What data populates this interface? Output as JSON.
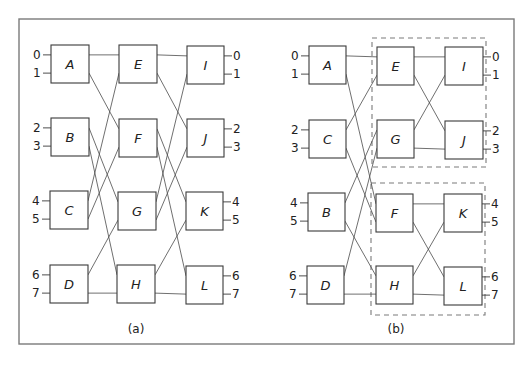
{
  "figure": {
    "frame": {
      "x": 19,
      "y": 19,
      "w": 495,
      "h": 325
    },
    "panels": [
      {
        "id": "a",
        "caption": "(a)",
        "caption_pos": [
          136,
          329
        ],
        "nodes": [
          {
            "label": "A",
            "x": 51,
            "y": 45,
            "w": 38,
            "h": 38
          },
          {
            "label": "B",
            "x": 51,
            "y": 118,
            "w": 38,
            "h": 38
          },
          {
            "label": "C",
            "x": 50,
            "y": 191,
            "w": 38,
            "h": 38
          },
          {
            "label": "D",
            "x": 50,
            "y": 265,
            "w": 38,
            "h": 38
          },
          {
            "label": "E",
            "x": 119,
            "y": 45,
            "w": 38,
            "h": 38
          },
          {
            "label": "F",
            "x": 119,
            "y": 119,
            "w": 38,
            "h": 38
          },
          {
            "label": "G",
            "x": 118,
            "y": 192,
            "w": 38,
            "h": 38
          },
          {
            "label": "H",
            "x": 117,
            "y": 265,
            "w": 38,
            "h": 38
          },
          {
            "label": "I",
            "x": 187,
            "y": 46,
            "w": 37,
            "h": 38
          },
          {
            "label": "J",
            "x": 187,
            "y": 119,
            "w": 37,
            "h": 38
          },
          {
            "label": "K",
            "x": 186,
            "y": 192,
            "w": 37,
            "h": 38
          },
          {
            "label": "L",
            "x": 186,
            "y": 266,
            "w": 37,
            "h": 38
          }
        ],
        "inputs_side": "left",
        "input_ports": [
          {
            "label": "0",
            "node": "A",
            "port": "top"
          },
          {
            "label": "1",
            "node": "A",
            "port": "bot"
          },
          {
            "label": "2",
            "node": "B",
            "port": "top"
          },
          {
            "label": "3",
            "node": "B",
            "port": "bot"
          },
          {
            "label": "4",
            "node": "C",
            "port": "top"
          },
          {
            "label": "5",
            "node": "C",
            "port": "bot"
          },
          {
            "label": "6",
            "node": "D",
            "port": "top"
          },
          {
            "label": "7",
            "node": "D",
            "port": "bot"
          }
        ],
        "output_ports": [
          {
            "label": "0",
            "node": "I",
            "port": "top"
          },
          {
            "label": "1",
            "node": "I",
            "port": "bot"
          },
          {
            "label": "2",
            "node": "J",
            "port": "top"
          },
          {
            "label": "3",
            "node": "J",
            "port": "bot"
          },
          {
            "label": "4",
            "node": "K",
            "port": "top"
          },
          {
            "label": "5",
            "node": "K",
            "port": "bot"
          },
          {
            "label": "6",
            "node": "L",
            "port": "top"
          },
          {
            "label": "7",
            "node": "L",
            "port": "bot"
          }
        ],
        "edges": [
          [
            "A",
            "top",
            "E",
            "top"
          ],
          [
            "A",
            "bot",
            "F",
            "top"
          ],
          [
            "B",
            "top",
            "G",
            "top"
          ],
          [
            "B",
            "bot",
            "H",
            "top"
          ],
          [
            "C",
            "top",
            "E",
            "bot"
          ],
          [
            "C",
            "bot",
            "F",
            "bot"
          ],
          [
            "D",
            "top",
            "G",
            "bot"
          ],
          [
            "D",
            "bot",
            "H",
            "bot"
          ],
          [
            "E",
            "top",
            "I",
            "top"
          ],
          [
            "E",
            "bot",
            "J",
            "top"
          ],
          [
            "F",
            "top",
            "K",
            "top"
          ],
          [
            "F",
            "bot",
            "L",
            "top"
          ],
          [
            "G",
            "top",
            "I",
            "bot"
          ],
          [
            "G",
            "bot",
            "J",
            "bot"
          ],
          [
            "H",
            "top",
            "K",
            "bot"
          ],
          [
            "H",
            "bot",
            "L",
            "bot"
          ]
        ],
        "dashed_groups": []
      },
      {
        "id": "b",
        "caption": "(b)",
        "caption_pos": [
          396,
          329
        ],
        "nodes": [
          {
            "label": "A",
            "x": 309,
            "y": 46,
            "w": 37,
            "h": 38
          },
          {
            "label": "C",
            "x": 309,
            "y": 120,
            "w": 37,
            "h": 38
          },
          {
            "label": "B",
            "x": 308,
            "y": 193,
            "w": 37,
            "h": 38
          },
          {
            "label": "D",
            "x": 307,
            "y": 266,
            "w": 37,
            "h": 38
          },
          {
            "label": "E",
            "x": 377,
            "y": 47,
            "w": 37,
            "h": 38
          },
          {
            "label": "G",
            "x": 377,
            "y": 120,
            "w": 37,
            "h": 38
          },
          {
            "label": "F",
            "x": 376,
            "y": 194,
            "w": 37,
            "h": 38
          },
          {
            "label": "H",
            "x": 376,
            "y": 266,
            "w": 37,
            "h": 38
          },
          {
            "label": "I",
            "x": 445,
            "y": 47,
            "w": 38,
            "h": 38
          },
          {
            "label": "J",
            "x": 445,
            "y": 121,
            "w": 38,
            "h": 38
          },
          {
            "label": "K",
            "x": 444,
            "y": 194,
            "w": 38,
            "h": 38
          },
          {
            "label": "L",
            "x": 444,
            "y": 267,
            "w": 38,
            "h": 38
          }
        ],
        "input_ports": [
          {
            "label": "0",
            "node": "A",
            "port": "top"
          },
          {
            "label": "1",
            "node": "A",
            "port": "bot"
          },
          {
            "label": "2",
            "node": "C",
            "port": "top"
          },
          {
            "label": "3",
            "node": "C",
            "port": "bot"
          },
          {
            "label": "4",
            "node": "B",
            "port": "top"
          },
          {
            "label": "5",
            "node": "B",
            "port": "bot"
          },
          {
            "label": "6",
            "node": "D",
            "port": "top"
          },
          {
            "label": "7",
            "node": "D",
            "port": "bot"
          }
        ],
        "output_ports": [
          {
            "label": "0",
            "node": "I",
            "port": "top"
          },
          {
            "label": "1",
            "node": "I",
            "port": "bot"
          },
          {
            "label": "2",
            "node": "J",
            "port": "top"
          },
          {
            "label": "3",
            "node": "J",
            "port": "bot"
          },
          {
            "label": "4",
            "node": "K",
            "port": "top"
          },
          {
            "label": "5",
            "node": "K",
            "port": "bot"
          },
          {
            "label": "6",
            "node": "L",
            "port": "top"
          },
          {
            "label": "7",
            "node": "L",
            "port": "bot"
          }
        ],
        "edges": [
          [
            "A",
            "top",
            "E",
            "top"
          ],
          [
            "A",
            "bot",
            "F",
            "top"
          ],
          [
            "C",
            "top",
            "E",
            "bot"
          ],
          [
            "C",
            "bot",
            "F",
            "bot"
          ],
          [
            "B",
            "top",
            "G",
            "top"
          ],
          [
            "B",
            "bot",
            "H",
            "top"
          ],
          [
            "D",
            "top",
            "G",
            "bot"
          ],
          [
            "D",
            "bot",
            "H",
            "bot"
          ],
          [
            "E",
            "top",
            "I",
            "top"
          ],
          [
            "E",
            "bot",
            "J",
            "top"
          ],
          [
            "G",
            "top",
            "I",
            "bot"
          ],
          [
            "G",
            "bot",
            "J",
            "bot"
          ],
          [
            "F",
            "top",
            "K",
            "top"
          ],
          [
            "F",
            "bot",
            "L",
            "top"
          ],
          [
            "H",
            "top",
            "K",
            "bot"
          ],
          [
            "H",
            "bot",
            "L",
            "bot"
          ]
        ],
        "dashed_groups": [
          {
            "name": "upper-subnetwork",
            "x": 372,
            "y": 38,
            "w": 114,
            "h": 129
          },
          {
            "name": "lower-subnetwork",
            "x": 371,
            "y": 183,
            "w": 114,
            "h": 132
          }
        ]
      }
    ]
  }
}
